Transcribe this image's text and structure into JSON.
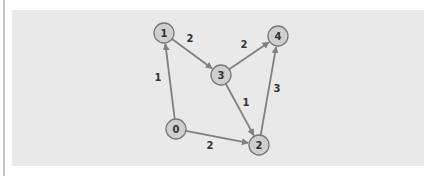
{
  "diagram": {
    "type": "weighted-directed-graph",
    "colors": {
      "panel_background": "#e9e9e9",
      "node_fill": "#cfcfcf",
      "node_stroke": "#777777",
      "edge": "#808080",
      "text": "#333333"
    },
    "nodes": [
      {
        "id": "0",
        "label": "0",
        "x": 176,
        "y": 129
      },
      {
        "id": "1",
        "label": "1",
        "x": 164,
        "y": 33
      },
      {
        "id": "2",
        "label": "2",
        "x": 259,
        "y": 145
      },
      {
        "id": "3",
        "label": "3",
        "x": 221,
        "y": 75
      },
      {
        "id": "4",
        "label": "4",
        "x": 278,
        "y": 36
      }
    ],
    "edges": [
      {
        "from": "0",
        "to": "1",
        "weight": "1",
        "label_x": 158,
        "label_y": 77
      },
      {
        "from": "0",
        "to": "2",
        "weight": "2",
        "label_x": 210,
        "label_y": 145
      },
      {
        "from": "1",
        "to": "3",
        "weight": "2",
        "label_x": 190,
        "label_y": 38
      },
      {
        "from": "3",
        "to": "4",
        "weight": "2",
        "label_x": 244,
        "label_y": 44
      },
      {
        "from": "3",
        "to": "2",
        "weight": "1",
        "label_x": 246,
        "label_y": 102
      },
      {
        "from": "2",
        "to": "4",
        "weight": "3",
        "label_x": 277,
        "label_y": 88
      }
    ]
  }
}
